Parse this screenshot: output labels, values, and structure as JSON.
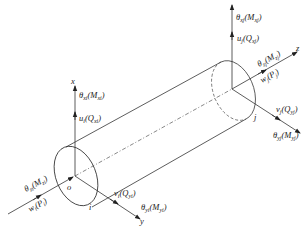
{
  "diagram": {
    "axes": {
      "x": "x",
      "y": "y",
      "z": "z"
    },
    "origin_label": "o",
    "nodes": {
      "i": "i",
      "j": "j"
    },
    "node_i": {
      "theta_x": {
        "sym": "θ",
        "sub": "xi",
        "paren": "M",
        "psub": "xi"
      },
      "u": {
        "sym": "u",
        "sub": "i",
        "paren": "Q",
        "psub": "xi"
      },
      "theta_z": {
        "sym": "θ",
        "sub": "zi",
        "paren": "M",
        "psub": "zi"
      },
      "w": {
        "sym": "w",
        "sub": "i",
        "paren": "P",
        "psub": "i"
      },
      "v": {
        "sym": "v",
        "sub": "i",
        "paren": "Q",
        "psub": "yi"
      },
      "theta_y": {
        "sym": "θ",
        "sub": "yi",
        "paren": "M",
        "psub": "yi"
      }
    },
    "node_j": {
      "theta_x": {
        "sym": "θ",
        "sub": "xj",
        "paren": "M",
        "psub": "xj"
      },
      "u": {
        "sym": "u",
        "sub": "j",
        "paren": "Q",
        "psub": "xj"
      },
      "theta_z": {
        "sym": "θ",
        "sub": "zj",
        "paren": "M",
        "psub": "zj"
      },
      "w": {
        "sym": "w",
        "sub": "j",
        "paren": "P",
        "psub": "j"
      },
      "v": {
        "sym": "v",
        "sub": "j",
        "paren": "Q",
        "psub": "yj"
      },
      "theta_y": {
        "sym": "θ",
        "sub": "yj",
        "paren": "M",
        "psub": "yj"
      }
    }
  }
}
